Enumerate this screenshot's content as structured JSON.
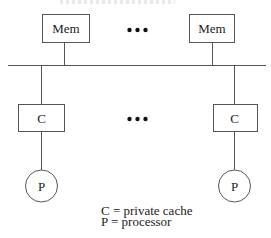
{
  "diagram": {
    "type": "shared-bus multiprocessor",
    "memories": [
      {
        "label": "Mem",
        "x": 42,
        "y": 14,
        "w": 47,
        "h": 28,
        "connector_x": 64
      },
      {
        "label": "Mem",
        "x": 189,
        "y": 14,
        "w": 45,
        "h": 28,
        "connector_x": 212
      }
    ],
    "memory_ellipsis": {
      "x": 137,
      "y": 30
    },
    "bus": {
      "x1": 8,
      "x2": 266,
      "y": 65
    },
    "caches": [
      {
        "label": "C",
        "x": 18,
        "y": 104,
        "w": 46,
        "h": 27,
        "cx": 41
      },
      {
        "label": "C",
        "x": 213,
        "y": 104,
        "w": 44,
        "h": 27,
        "cx": 234
      }
    ],
    "cache_ellipsis": {
      "x": 137,
      "y": 119
    },
    "processors": [
      {
        "label": "P",
        "cx": 41,
        "cy": 186,
        "r": 16
      },
      {
        "label": "P",
        "cx": 234,
        "cy": 186,
        "r": 16
      }
    ],
    "legend": [
      {
        "text": "C = private cache"
      },
      {
        "text": "P = processor"
      }
    ]
  }
}
